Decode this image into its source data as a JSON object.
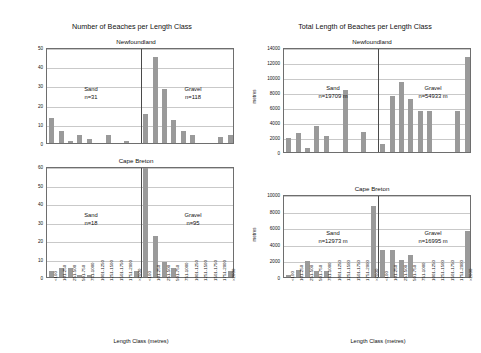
{
  "figure": {
    "left_title": "Number of Beaches per Length Class",
    "right_title": "Total Length of Beaches per Length Class",
    "xlabel": "Length Class (metres)",
    "ylabel_metres": "metres",
    "categories": [
      "<100",
      "101-250",
      "251-500",
      "501-750",
      "751-1000",
      "1001-1250",
      "1251-1500",
      "1501-1750",
      "1751-2000",
      ">2000"
    ],
    "bar_color": "#9a9a9a",
    "grid_color": "#c9c9c9",
    "axis_color": "#6e6e6e"
  },
  "panels": {
    "nl_count": {
      "subtitle": "Newfoundland",
      "sand_label": "Sand",
      "sand_n": "n=31",
      "gravel_label": "Gravel",
      "gravel_n": "n=118",
      "yticks": [
        "0",
        "10",
        "20",
        "30",
        "40",
        "50"
      ]
    },
    "cb_count": {
      "subtitle": "Cape Breton",
      "sand_label": "Sand",
      "sand_n": "n=18",
      "gravel_label": "Gravel",
      "gravel_n": "n=95",
      "yticks": [
        "0",
        "10",
        "20",
        "30",
        "40",
        "50",
        "60"
      ]
    },
    "nl_length": {
      "subtitle": "Newfoundland",
      "sand_label": "Sand",
      "sand_n": "n=19709 m",
      "gravel_label": "Gravel",
      "gravel_n": "n=54933 m",
      "yticks": [
        "0",
        "2000",
        "4000",
        "6000",
        "8000",
        "10000",
        "12000",
        "14000"
      ]
    },
    "cb_length": {
      "subtitle": "Cape Breton",
      "sand_label": "Sand",
      "sand_n": "n=12973 m",
      "gravel_label": "Gravel",
      "gravel_n": "n=16995 m",
      "yticks": [
        "0",
        "2000",
        "4000",
        "6000",
        "8000",
        "10000"
      ]
    }
  },
  "chart_data": [
    {
      "id": "nl_count",
      "type": "bar",
      "title": "Number of Beaches per Length Class",
      "subtitle": "Newfoundland",
      "xlabel": "Length Class (metres)",
      "ylabel": "",
      "ylim": [
        0,
        50
      ],
      "yticks": [
        0,
        10,
        20,
        30,
        40,
        50
      ],
      "grid": true,
      "categories": [
        "<100",
        "101-250",
        "251-500",
        "501-750",
        "751-1000",
        "1001-1250",
        "1251-1500",
        "1501-1750",
        "1751-2000",
        ">2000"
      ],
      "series": [
        {
          "name": "Sand",
          "n": 31,
          "values": [
            13,
            6,
            1,
            4,
            2,
            0,
            4,
            0,
            1,
            0
          ]
        },
        {
          "name": "Gravel",
          "n": 118,
          "values": [
            15,
            45,
            28,
            12,
            6,
            4,
            0,
            0,
            3,
            4
          ]
        }
      ]
    },
    {
      "id": "cb_count",
      "type": "bar",
      "title": "Number of Beaches per Length Class",
      "subtitle": "Cape Breton",
      "xlabel": "Length Class (metres)",
      "ylabel": "",
      "ylim": [
        0,
        60
      ],
      "yticks": [
        0,
        10,
        20,
        30,
        40,
        50,
        60
      ],
      "grid": true,
      "categories": [
        "<100",
        "101-250",
        "251-500",
        "501-750",
        "751-1000",
        "1001-1250",
        "1251-1500",
        "1501-1750",
        "1751-2000",
        ">2000"
      ],
      "series": [
        {
          "name": "Sand",
          "n": 18,
          "values": [
            3,
            5,
            5,
            1,
            1,
            0,
            0,
            0,
            0,
            3
          ]
        },
        {
          "name": "Gravel",
          "n": 95,
          "values": [
            60,
            22,
            8,
            5,
            0,
            0,
            0,
            0,
            0,
            3
          ]
        }
      ]
    },
    {
      "id": "nl_length",
      "type": "bar",
      "title": "Total Length of Beaches per Length Class",
      "subtitle": "Newfoundland",
      "xlabel": "Length Class (metres)",
      "ylabel": "metres",
      "ylim": [
        0,
        14000
      ],
      "yticks": [
        0,
        2000,
        4000,
        6000,
        8000,
        10000,
        12000,
        14000
      ],
      "grid": true,
      "categories": [
        "<100",
        "101-250",
        "251-500",
        "501-750",
        "751-1000",
        "1001-1250",
        "1251-1500",
        "1501-1750",
        "1751-2000",
        ">2000"
      ],
      "series": [
        {
          "name": "Sand",
          "total_m": 19709,
          "values": [
            1900,
            2550,
            500,
            3450,
            2150,
            0,
            8250,
            0,
            2700,
            0
          ]
        },
        {
          "name": "Gravel",
          "total_m": 54933,
          "values": [
            1050,
            7450,
            9400,
            7100,
            5450,
            5500,
            0,
            0,
            5450,
            12650
          ]
        }
      ]
    },
    {
      "id": "cb_length",
      "type": "bar",
      "title": "Total Length of Beaches per Length Class",
      "subtitle": "Cape Breton",
      "xlabel": "Length Class (metres)",
      "ylabel": "metres",
      "ylim": [
        0,
        10000
      ],
      "yticks": [
        0,
        2000,
        4000,
        6000,
        8000,
        10000
      ],
      "grid": true,
      "categories": [
        "<100",
        "101-250",
        "251-500",
        "501-750",
        "751-1000",
        "1001-1250",
        "1251-1500",
        "1501-1750",
        "1751-2000",
        ">2000"
      ],
      "series": [
        {
          "name": "Sand",
          "total_m": 12973,
          "values": [
            200,
            800,
            1900,
            700,
            700,
            0,
            0,
            0,
            0,
            8500
          ]
        },
        {
          "name": "Gravel",
          "total_m": 16995,
          "values": [
            3200,
            3200,
            2100,
            2700,
            0,
            0,
            0,
            0,
            0,
            5500
          ]
        }
      ]
    }
  ]
}
